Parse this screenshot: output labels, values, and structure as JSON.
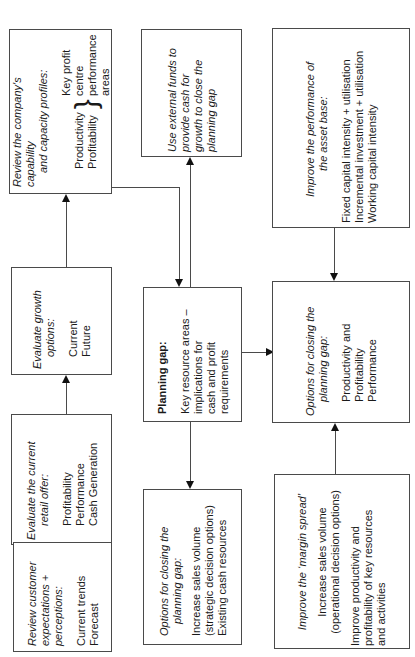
{
  "diagram": {
    "orientation": "rotated 90 degrees counter-clockwise",
    "boxes": {
      "customer": {
        "title_lines": [
          "Review customer",
          "expectations +",
          "perceptions:"
        ],
        "items": [
          "Current trends",
          "Forecast"
        ]
      },
      "retail_offer": {
        "title_lines": [
          "Evaluate the current",
          "retail offer:"
        ],
        "items": [
          "Profitability",
          "Performance",
          "Cash Generation"
        ]
      },
      "growth": {
        "title_lines": [
          "Evaluate growth",
          "options:"
        ],
        "items": [
          "Current",
          "Future"
        ]
      },
      "capability": {
        "title_lines": [
          "Review the company's capability",
          "and capacity profiles:"
        ],
        "brace_left": [
          "Productivity",
          "Profitability"
        ],
        "brace_right": [
          "Key profit",
          "centre",
          "performance",
          "areas"
        ]
      },
      "external_funds": {
        "lines": [
          "Use external funds to",
          "provide cash for",
          "growth to close the",
          "planning gap"
        ]
      },
      "planning_gap": {
        "title": "Planning gap:",
        "lines": [
          "Key resource areas –",
          "implications for",
          "cash and profit",
          "requirements"
        ]
      },
      "options_strategic": {
        "title_lines": [
          "Options for closing the",
          "planning gap:"
        ],
        "items": [
          "Increase sales volume",
          "(strategic decision options)",
          "Existing cash resources"
        ]
      },
      "asset_base": {
        "title_lines": [
          "Improve the performance of",
          "the asset base:"
        ],
        "items": [
          "Fixed capital intensity + utilisation",
          "Incremental investment + utilisation",
          "Working capital intensity"
        ]
      },
      "options_productivity": {
        "title_lines": [
          "Options for closing the",
          "planning gap:"
        ],
        "items": [
          "Productivity and",
          "Profitability",
          "Performance"
        ]
      },
      "margin_spread": {
        "title": "Improve the ‘margin spread’",
        "group1": [
          "Increase sales volume",
          "(operational decision options)"
        ],
        "group2": [
          "Improve productivity and",
          "profitability of key resources",
          "and activities"
        ]
      }
    },
    "connections": [
      {
        "from": "customer",
        "to": "retail_offer"
      },
      {
        "from": "retail_offer",
        "to": "growth"
      },
      {
        "from": "growth",
        "to": "capability"
      },
      {
        "from": "capability",
        "to": "planning_gap"
      },
      {
        "from": "planning_gap",
        "to": "external_funds"
      },
      {
        "from": "planning_gap",
        "to": "options_strategic"
      },
      {
        "from": "planning_gap",
        "to": "options_productivity"
      },
      {
        "from": "asset_base",
        "to": "options_productivity"
      },
      {
        "from": "margin_spread",
        "to": "options_productivity"
      }
    ]
  }
}
